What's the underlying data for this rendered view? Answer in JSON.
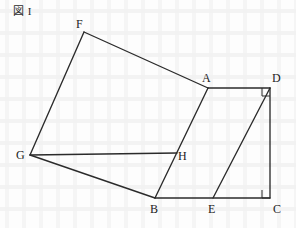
{
  "figure": {
    "caption": "図 I",
    "caption_mark_icon": "cjk-zu-character",
    "width": 296,
    "height": 228,
    "background_color": "#fdfdfd",
    "stroke_color": "#2b2b2b",
    "label_color": "#1c1c1c"
  },
  "vertices": [
    {
      "id": "F",
      "label": "F",
      "x": 84,
      "y": 32,
      "label_x": 76,
      "label_y": 18
    },
    {
      "id": "A",
      "label": "A",
      "x": 208,
      "y": 88,
      "label_x": 202,
      "label_y": 72
    },
    {
      "id": "D",
      "label": "D",
      "x": 270,
      "y": 88,
      "label_x": 272,
      "label_y": 72
    },
    {
      "id": "G",
      "label": "G",
      "x": 30,
      "y": 155,
      "label_x": 16,
      "label_y": 149
    },
    {
      "id": "H",
      "label": "H",
      "x": 175,
      "y": 155,
      "label_x": 178,
      "label_y": 150
    },
    {
      "id": "B",
      "label": "B",
      "x": 155,
      "y": 198,
      "label_x": 150,
      "label_y": 203
    },
    {
      "id": "E",
      "label": "E",
      "x": 213,
      "y": 198,
      "label_x": 208,
      "label_y": 203
    },
    {
      "id": "C",
      "label": "C",
      "x": 270,
      "y": 198,
      "label_x": 273,
      "label_y": 203
    }
  ],
  "edges": [
    {
      "id": "GF",
      "from": "G",
      "to": "F",
      "x1": 30,
      "y1": 155,
      "x2": 84,
      "y2": 32
    },
    {
      "id": "FA",
      "from": "F",
      "to": "A",
      "x1": 84,
      "y1": 32,
      "x2": 208,
      "y2": 88
    },
    {
      "id": "AD",
      "from": "A",
      "to": "D",
      "x1": 208,
      "y1": 88,
      "x2": 270,
      "y2": 88
    },
    {
      "id": "DC",
      "from": "D",
      "to": "C",
      "x1": 270,
      "y1": 88,
      "x2": 270,
      "y2": 198
    },
    {
      "id": "DE",
      "from": "D",
      "to": "E",
      "x1": 270,
      "y1": 88,
      "x2": 213,
      "y2": 198
    },
    {
      "id": "AB",
      "from": "A",
      "to": "B",
      "x1": 208,
      "y1": 88,
      "x2": 155,
      "y2": 198
    },
    {
      "id": "GH",
      "from": "G",
      "to": "H",
      "x1": 30,
      "y1": 155,
      "x2": 177,
      "y2": 153
    },
    {
      "id": "GB",
      "from": "G",
      "to": "B",
      "x1": 30,
      "y1": 155,
      "x2": 155,
      "y2": 198
    },
    {
      "id": "BC",
      "from": "B",
      "to": "C",
      "x1": 155,
      "y1": 198,
      "x2": 270,
      "y2": 198
    }
  ],
  "right_angle_markers": [
    {
      "id": "angle-at-D",
      "at": "D",
      "points": "262,88 262,96 270,96",
      "description": "right angle between AD and DC at vertex D"
    },
    {
      "id": "angle-at-C",
      "at": "C",
      "points": "262,190 262,198 270,198",
      "description": "right angle between BC and DC at vertex C"
    }
  ]
}
